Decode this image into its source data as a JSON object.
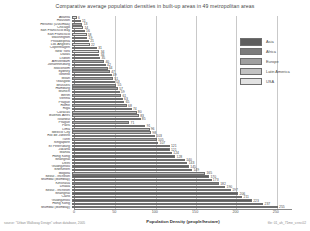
{
  "chart_data": {
    "type": "bar",
    "orientation": "horizontal",
    "title": "Comparative  average population densities in built-up areas in 49 metropolitan areas",
    "xlabel": "Population Density (people/hectare)",
    "ylabel": "",
    "xlim": [
      0,
      270
    ],
    "xticks": [
      0,
      50,
      100,
      150,
      200,
      250
    ],
    "grid": true,
    "legend_position": "top-right",
    "legend": [
      "Asia",
      "Africa",
      "Europe",
      "Latin America",
      "USA"
    ],
    "legend_colors": [
      "#5e5e5e",
      "#7c7c7c",
      "#a0a0a0",
      "#c2c2c2",
      "#e2e2e2"
    ],
    "categories": [
      "Atlanta",
      "Houston",
      "Helsinki (Uusimaa)",
      "Chicago",
      "San Francisco Bay",
      "San Francisco",
      "Washington",
      "Philadelphia",
      "Los Angeles",
      "Copenhagen",
      "New York",
      "Dallas",
      "Lisbon",
      "Amsterdam",
      "Johannesburg",
      "Stockholm",
      "Sydney",
      "Toronto",
      "Milan",
      "Glasgow",
      "Brussels",
      "Hamburg",
      "Munich",
      "Berlin",
      "Vienna",
      "Prague",
      "Rome",
      "Riga",
      "Caracas",
      "Buenos Aires",
      "Istanbul",
      "Prague",
      "Paris",
      "Lima",
      "Mexico City",
      "Rio de Janeiro",
      "Turin",
      "Singapore",
      "St Petersburg",
      "Jakarta",
      "Manila",
      "Hong Kong",
      "Shanghai",
      "Delhi",
      "Guangzhou",
      "Shenzhen",
      "Bogota",
      "Seoul - Incheon",
      "Mumbai (Bombay)"
    ],
    "values": [
      6,
      11,
      13,
      14,
      16,
      18,
      19,
      21,
      22,
      31,
      34,
      34,
      35,
      40,
      42,
      44,
      47,
      49,
      51,
      53,
      55,
      57,
      59,
      61,
      63,
      65,
      68,
      74,
      80,
      83,
      85,
      71,
      91,
      96,
      98,
      103,
      105,
      107,
      121,
      121,
      124,
      128,
      140,
      143,
      145,
      149,
      165,
      170,
      173
    ],
    "regions": [
      "USA",
      "USA",
      "Europe",
      "USA",
      "USA",
      "USA",
      "USA",
      "USA",
      "USA",
      "Europe",
      "USA",
      "USA",
      "Europe",
      "Europe",
      "Africa",
      "Europe",
      "Europe",
      "USA",
      "Europe",
      "Europe",
      "Europe",
      "Europe",
      "Europe",
      "Europe",
      "Europe",
      "Europe",
      "Europe",
      "Europe",
      "Latin America",
      "Latin America",
      "Europe",
      "Europe",
      "Europe",
      "Latin America",
      "Latin America",
      "Latin America",
      "Europe",
      "Asia",
      "Europe",
      "Asia",
      "Asia",
      "Asia",
      "Asia",
      "Asia",
      "Asia",
      "Asia",
      "Latin America",
      "Asia",
      "Asia"
    ],
    "extra_bottom_categories": [
      "Kinshasa",
      "Dhaka",
      "Seoul - Incheon",
      "Shanghai",
      "Cairo",
      "Guangzhou",
      "Hong Kong",
      "Mumbai (Bombay)"
    ],
    "extra_bottom_values": [
      182,
      190,
      197,
      206,
      211,
      223,
      237,
      255
    ],
    "extra_bottom_regions": [
      "Africa",
      "Asia",
      "Asia",
      "Asia",
      "Africa",
      "Asia",
      "Asia",
      "Asia"
    ]
  },
  "source_note": "source: \"Urban Walkway Design\" urban database, 2005",
  "credit_note": "file: 01_ah_71me_v.rev.02"
}
